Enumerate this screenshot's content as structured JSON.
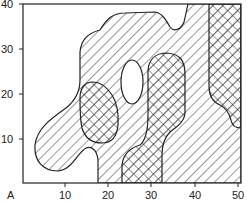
{
  "figure": {
    "panel_label": "A",
    "x_axis": {
      "ticks": [
        "10",
        "20",
        "30",
        "40",
        "50"
      ],
      "range": [
        0,
        50
      ]
    },
    "y_axis": {
      "ticks": [
        "10",
        "20",
        "30",
        "40"
      ],
      "range": [
        0,
        40
      ]
    },
    "legend": null
  },
  "regions": [
    {
      "name": "main-single-hatched-region",
      "pattern": "single-hatch"
    },
    {
      "name": "left-crosshatched-region",
      "pattern": "cross-hatch"
    },
    {
      "name": "middle-crosshatched-region",
      "pattern": "cross-hatch"
    },
    {
      "name": "right-crosshatched-region",
      "pattern": "cross-hatch"
    },
    {
      "name": "unhatched-hole",
      "pattern": "none"
    }
  ],
  "colors": {
    "line": "#222222",
    "background": "#ffffff"
  }
}
